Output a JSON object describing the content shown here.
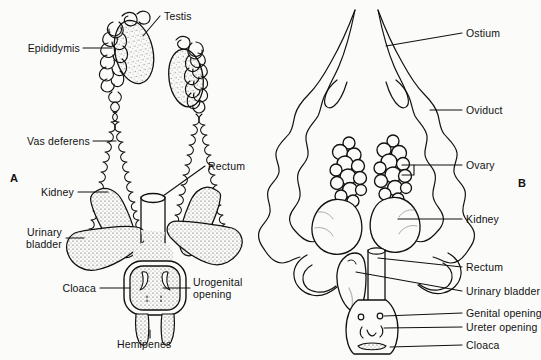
{
  "figure": {
    "background_color": "#fbfbfa",
    "ink_color": "#111111"
  },
  "panels": [
    {
      "id": "A",
      "letter": "A",
      "subject": "male-urogenital-system"
    },
    {
      "id": "B",
      "letter": "B",
      "subject": "female-urogenital-system"
    }
  ],
  "labels_left": {
    "testis": "Testis",
    "epididymis": "Epididymis",
    "vas_deferens": "Vas  deferens",
    "rectum": "Rectum",
    "kidney": "Kidney",
    "urinary_bladder_line1": "Urinary",
    "urinary_bladder_line2": "bladder",
    "cloaca": "Cloaca",
    "urogenital_opening_line1": "Urogenital",
    "urogenital_opening_line2": "opening",
    "hemipenes": "Hemipenes"
  },
  "labels_right": {
    "ostium": "Ostium",
    "oviduct": "Oviduct",
    "ovary": "Ovary",
    "kidney": "Kidney",
    "rectum": "Rectum",
    "urinary_bladder": "Urinary  bladder",
    "genital_opening": "Genital  opening",
    "ureter_opening": "Ureter  opening",
    "cloaca": "Cloaca"
  }
}
